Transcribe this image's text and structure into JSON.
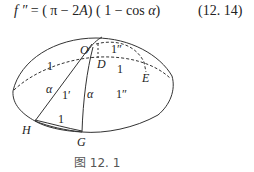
{
  "formula": {
    "lhs": "f ″",
    "eq": " = ( π − 2",
    "var_A": "A",
    "mid": ") ( 1 − cos ",
    "var_alpha": "α",
    "close": ")",
    "number": "(12. 14)"
  },
  "figure": {
    "caption": "图 12. 1",
    "labels": {
      "O": "O",
      "D": "D",
      "E": "E",
      "H": "H",
      "G": "G",
      "one_left": "1",
      "one_dprime_top": "1″",
      "one_mid": "1",
      "alpha_left": "α",
      "one_prime": "1′",
      "alpha_right": "α",
      "one_dprime_right": "1″",
      "one_bottom": "1"
    }
  }
}
